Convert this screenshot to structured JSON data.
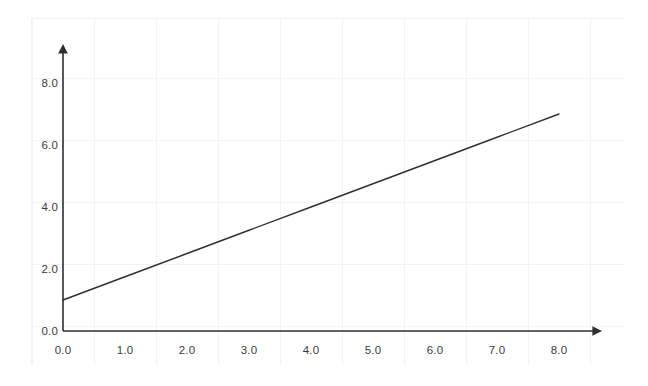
{
  "chart_data": {
    "type": "line",
    "title": "",
    "xlabel": "",
    "ylabel": "",
    "xlim": [
      0.0,
      8.0
    ],
    "ylim": [
      0.0,
      8.0
    ],
    "grid": true,
    "legend": false,
    "axis_style": "arrow-terminated",
    "xticks": [
      "0.0",
      "1.0",
      "2.0",
      "3.0",
      "4.0",
      "5.0",
      "6.0",
      "7.0",
      "8.0"
    ],
    "xtick_values": [
      0.0,
      1.0,
      2.0,
      3.0,
      4.0,
      5.0,
      6.0,
      7.0,
      8.0
    ],
    "yticks": [
      "0.0",
      "2.0",
      "4.0",
      "6.0",
      "8.0"
    ],
    "ytick_values": [
      0.0,
      2.0,
      4.0,
      6.0,
      8.0
    ],
    "series": [
      {
        "name": "line",
        "color": "#2e2e33",
        "x": [
          0.0,
          1.0,
          2.0,
          3.0,
          4.0,
          5.0,
          6.0,
          7.0,
          8.0
        ],
        "values": [
          1.0,
          1.75,
          2.5,
          3.25,
          4.0,
          4.75,
          5.5,
          6.25,
          7.0
        ]
      }
    ]
  },
  "colors": {
    "axis": "#2e2e33",
    "line": "#2e2e33",
    "grid": "#f2f2f4",
    "tick_text": "#3b3b3f",
    "background": "#ffffff"
  }
}
